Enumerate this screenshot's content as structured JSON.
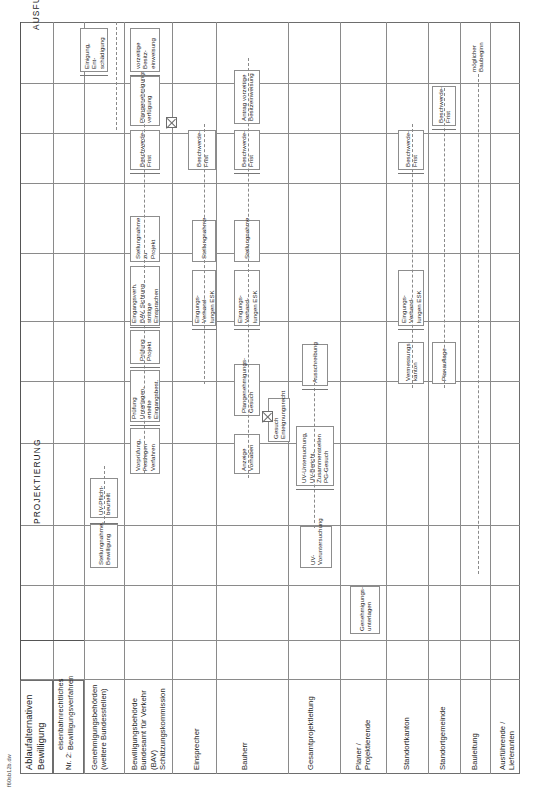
{
  "document": {
    "title_line1": "Ablaufalternativen",
    "title_line2": "Bewilligung",
    "subtitle_number": "Nr. 2:",
    "subtitle_line1": "eisenbahnrechtliches",
    "subtitle_line2": "Bewilligungsverfahren",
    "sheet_code": "f60sb12b.dw"
  },
  "phases": [
    {
      "id": "projektierung",
      "label": "PROJEKTIERUNG"
    },
    {
      "id": "ausfuehrung",
      "label": "AUSFUEHRUNG"
    }
  ],
  "lanes": [
    {
      "id": "genehmigungsbehoerden",
      "label": "Genehmigungsbehörden\n(weitere Bundesstellen)"
    },
    {
      "id": "bewilligungsbehoerde",
      "label": "Bewilligungsbehörde\nBundesamt für Verkehr\n(BAV)\nSchätzungskommission"
    },
    {
      "id": "einsprecher",
      "label": "Einsprecher"
    },
    {
      "id": "bauherr",
      "label": "Bauherr"
    },
    {
      "id": "gesamtprojektleitung",
      "label": "Gesamtprojektleitung"
    },
    {
      "id": "planer",
      "label": "Planer /\nProjektierende"
    },
    {
      "id": "standortkanton",
      "label": "Standortkanton"
    },
    {
      "id": "standortgemeinde",
      "label": "Standortgemeinde"
    },
    {
      "id": "bauleitung",
      "label": "Bauleitung"
    },
    {
      "id": "ausfuehrende",
      "label": "Ausführende /\nLieferanten"
    }
  ],
  "nodes": [
    {
      "id": "n01",
      "lane": "genehmigungsbehoerden",
      "text": "Stellungnahme,\nBewilligung"
    },
    {
      "id": "n02",
      "lane": "genehmigungsbehoerden",
      "text": "UV-Pflicht-\nbeurteilt",
      "text_full": "UV-Pflicht-\nverbindl. UV-\nbeurteilt"
    },
    {
      "id": "n03",
      "lane": "genehmigungsbehoerden",
      "text": "verbindl. UV-\nPflichtenheft"
    },
    {
      "id": "n04",
      "lane": "bewilligungsbehoerde",
      "text": "Vorprüfung,\nFestlegen Verfahren"
    },
    {
      "id": "n05",
      "lane": "bewilligungsbehoerde",
      "text": "Prüfung Unterlagen,\nerteilte Eingangsbest."
    },
    {
      "id": "n06",
      "lane": "bewilligungsbehoerde",
      "text": "Prüfung\nProjekt"
    },
    {
      "id": "n07",
      "lane": "bewilligungsbehoerde",
      "text": "Eingangsverh. BAV, Sichtung\nstrittige Einsprachen"
    },
    {
      "id": "n08",
      "lane": "bewilligungsbehoerde",
      "text": "Stellungnahme zu\nProjekt"
    },
    {
      "id": "n09",
      "lane": "bewilligungsbehoerde",
      "text": "Beschwerde-\nFrist"
    },
    {
      "id": "n10",
      "lane": "bewilligungsbehoerde",
      "text": "Plangenehmigungs-\nverfügung"
    },
    {
      "id": "n11",
      "lane": "bewilligungsbehoerde",
      "text": "vorzeitige Besitz-\neinweisung"
    },
    {
      "id": "n12",
      "lane": "bewilligungsbehoerde",
      "text": "Einigung, Ent-\nschädigung"
    },
    {
      "id": "n13",
      "lane": "einsprecher",
      "text": "Beschwerde-\nFrist"
    },
    {
      "id": "n14",
      "lane": "einsprecher",
      "text": "Eingungs-Verhand-\nlungen ESK"
    },
    {
      "id": "n15",
      "lane": "einsprecher",
      "text": "Stellungnahme"
    },
    {
      "id": "n16",
      "lane": "bauherr",
      "text": "Beschwerde-\nFrist"
    },
    {
      "id": "n17",
      "lane": "bauherr",
      "text": "Antrag vorzeitige\nBesitzeinweisung"
    },
    {
      "id": "n18",
      "lane": "bauherr",
      "text": "Eingungs-Verhand-\nlungen ESK"
    },
    {
      "id": "n19",
      "lane": "bauherr",
      "text": "Stellungnahme"
    },
    {
      "id": "n20",
      "lane": "bauherr",
      "text": "Plangenehmigungs-\nGesuch"
    },
    {
      "id": "n21",
      "lane": "bauherr",
      "text": "Anzeige\nVorhaben"
    },
    {
      "id": "n22",
      "lane": "bauherr",
      "text": "Gesuch\nEnteignungsrecht"
    },
    {
      "id": "n23",
      "lane": "gesamtprojektleitung",
      "text": "UV-Voruntersuchung"
    },
    {
      "id": "n24",
      "lane": "gesamtprojektleitung",
      "text": "UV-Untersuchung, UV-Bericht,\nZusammenstellen PG-Gesuch"
    },
    {
      "id": "n25",
      "lane": "gesamtprojektleitung",
      "text": "Ausschreibung"
    },
    {
      "id": "n26",
      "lane": "planer",
      "text": "Genehmigungs-\nunterlagen"
    },
    {
      "id": "n27",
      "lane": "standortkanton",
      "text": "Vermessungs\nkanton"
    },
    {
      "id": "n28",
      "lane": "standortkanton",
      "text": "Eingungs-Verhand-\nlungen ESK"
    },
    {
      "id": "n29",
      "lane": "standortkanton",
      "text": "Beschwerde-\nFrist"
    },
    {
      "id": "n30",
      "lane": "standortgemeinde",
      "text": "Planauflage"
    },
    {
      "id": "n31",
      "lane": "standortgemeinde",
      "text": "Beschwerde-\nFrist"
    },
    {
      "id": "n32",
      "lane": "bauleitung",
      "text": "möglicher Baubeginn"
    }
  ],
  "markers": [
    {
      "id": "m1",
      "type": "decision-x"
    },
    {
      "id": "m2",
      "type": "decision-x"
    },
    {
      "id": "m3",
      "type": "decision-x"
    }
  ]
}
